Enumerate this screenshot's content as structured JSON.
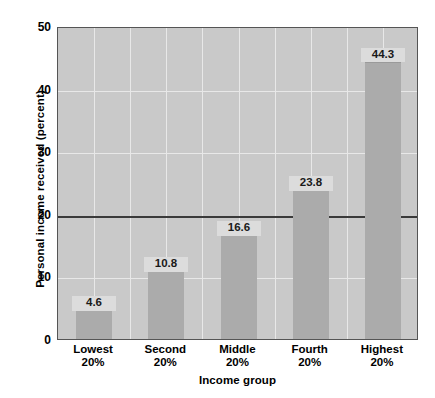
{
  "chart_data": {
    "type": "bar",
    "title": "",
    "subtitle": "",
    "xlabel": "Income group",
    "ylabel": "Personal income received (percent)",
    "categories": [
      "Lowest 20%",
      "Second 20%",
      "Middle 20%",
      "Fourth 20%",
      "Highest 20%"
    ],
    "category_lines": [
      {
        "line1": "Lowest",
        "line2": "20%"
      },
      {
        "line1": "Second",
        "line2": "20%"
      },
      {
        "line1": "Middle",
        "line2": "20%"
      },
      {
        "line1": "Fourth",
        "line2": "20%"
      },
      {
        "line1": "Highest",
        "line2": "20%"
      }
    ],
    "values": [
      4.6,
      10.8,
      16.6,
      23.8,
      44.3
    ],
    "data_labels": [
      "4.6",
      "10.8",
      "16.6",
      "23.8",
      "44.3"
    ],
    "ylim": [
      0,
      50
    ],
    "ytick_values": [
      0,
      10,
      20,
      30,
      40,
      50
    ],
    "ytick_labels": [
      "0",
      "10",
      "20",
      "30",
      "40",
      "50"
    ],
    "grid": true,
    "gridline_color": "#e8e8e8",
    "vertical_gridline_count": 10,
    "reference_line": {
      "value": 20,
      "color": "#3a3a3a"
    },
    "legend": null,
    "legend_position": "none",
    "bar_color": "#ababab",
    "plot_background_color": "#c9c9c9",
    "plot_border_color": "#555555",
    "page_background_color": "#ffffff",
    "text_color": "#000000",
    "data_label_background": "#dcdcdc"
  }
}
